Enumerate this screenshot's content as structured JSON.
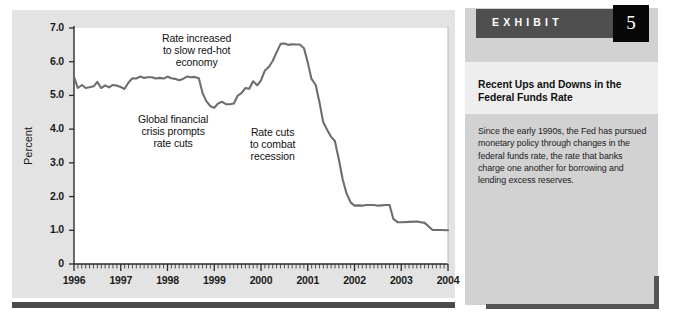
{
  "exhibit": {
    "label": "EXHIBIT",
    "number": "5",
    "title": "Recent Ups and Downs in the Federal Funds Rate",
    "body": "Since the early 1990s, the Fed has pursued monetary policy through changes in the federal funds rate, the rate that banks charge one another for borrowing and lending excess reserves.",
    "colors": {
      "header_bar": "#4f4f4f",
      "number_box": "#070707",
      "panel_bg": "#d2d2d2",
      "shadow": "#555555"
    }
  },
  "chart_data": {
    "type": "line",
    "title": "",
    "xlabel": "",
    "ylabel": "Percent",
    "ylim": [
      0,
      7.0
    ],
    "xlim": [
      1996,
      2004
    ],
    "yticks": [
      "0",
      "1.0",
      "2.0",
      "3.0",
      "4.0",
      "5.0",
      "6.0",
      "7.0"
    ],
    "ytick_values": [
      0,
      1.0,
      2.0,
      3.0,
      4.0,
      5.0,
      6.0,
      7.0
    ],
    "xticks": [
      "1996",
      "1997",
      "1998",
      "1999",
      "2000",
      "2001",
      "2002",
      "2003",
      "2004"
    ],
    "xtick_values": [
      1996,
      1997,
      1998,
      1999,
      2000,
      2001,
      2002,
      2003,
      2004
    ],
    "minor_xticks_per_year": 12,
    "grid": false,
    "legend": "none",
    "line_color": "#6e6e6e",
    "plot_bg": "#ffffff",
    "panel_bg": "#e3e3e3",
    "series": [
      {
        "name": "Federal funds rate",
        "x": [
          1996.0,
          1996.08,
          1996.17,
          1996.25,
          1996.33,
          1996.42,
          1996.5,
          1996.58,
          1996.67,
          1996.75,
          1996.83,
          1996.92,
          1997.0,
          1997.08,
          1997.17,
          1997.25,
          1997.33,
          1997.42,
          1997.5,
          1997.58,
          1997.67,
          1997.75,
          1997.83,
          1997.92,
          1998.0,
          1998.08,
          1998.17,
          1998.25,
          1998.33,
          1998.42,
          1998.5,
          1998.58,
          1998.67,
          1998.75,
          1998.83,
          1998.92,
          1999.0,
          1999.08,
          1999.17,
          1999.25,
          1999.33,
          1999.42,
          1999.5,
          1999.58,
          1999.67,
          1999.75,
          1999.83,
          1999.92,
          2000.0,
          2000.08,
          2000.17,
          2000.25,
          2000.33,
          2000.42,
          2000.5,
          2000.58,
          2000.67,
          2000.75,
          2000.83,
          2000.92,
          2001.0,
          2001.08,
          2001.17,
          2001.25,
          2001.33,
          2001.42,
          2001.5,
          2001.58,
          2001.67,
          2001.75,
          2001.83,
          2001.92,
          2002.0,
          2002.08,
          2002.17,
          2002.25,
          2002.33,
          2002.42,
          2002.5,
          2002.58,
          2002.67,
          2002.75,
          2002.83,
          2002.92,
          2003.0,
          2003.17,
          2003.33,
          2003.5,
          2003.67,
          2003.83,
          2004.0
        ],
        "values": [
          5.56,
          5.22,
          5.31,
          5.22,
          5.24,
          5.27,
          5.4,
          5.22,
          5.3,
          5.24,
          5.31,
          5.29,
          5.25,
          5.19,
          5.39,
          5.51,
          5.5,
          5.56,
          5.52,
          5.54,
          5.54,
          5.5,
          5.52,
          5.5,
          5.56,
          5.51,
          5.49,
          5.45,
          5.49,
          5.56,
          5.54,
          5.55,
          5.51,
          5.07,
          4.83,
          4.68,
          4.63,
          4.76,
          4.81,
          4.74,
          4.74,
          4.76,
          4.99,
          5.07,
          5.22,
          5.2,
          5.42,
          5.3,
          5.45,
          5.73,
          5.85,
          6.02,
          6.27,
          6.53,
          6.54,
          6.5,
          6.52,
          6.51,
          6.51,
          6.4,
          5.98,
          5.49,
          5.31,
          4.8,
          4.21,
          3.97,
          3.77,
          3.65,
          3.07,
          2.49,
          2.09,
          1.82,
          1.73,
          1.74,
          1.73,
          1.75,
          1.75,
          1.75,
          1.73,
          1.74,
          1.75,
          1.75,
          1.34,
          1.24,
          1.24,
          1.25,
          1.26,
          1.22,
          1.01,
          1.01,
          1.0
        ]
      }
    ],
    "annotations": [
      {
        "id": "rate-increase",
        "text": "Rate increased to slow red-hot economy",
        "lines": [
          "Rate increased",
          "to slow red-hot",
          "economy"
        ]
      },
      {
        "id": "global-crisis",
        "text": "Global financial crisis prompts rate cuts",
        "lines": [
          "Global financial",
          "crisis prompts",
          "rate cuts"
        ]
      },
      {
        "id": "rate-cuts",
        "text": "Rate cuts to combat recession",
        "lines": [
          "Rate cuts",
          "to combat",
          "recession"
        ]
      }
    ]
  }
}
